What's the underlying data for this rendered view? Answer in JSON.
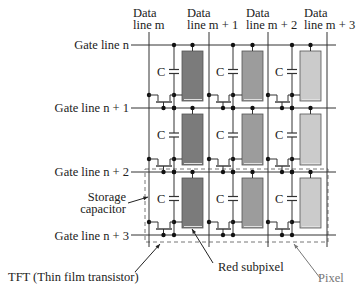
{
  "figure": {
    "type": "TFT active-matrix pixel array diagram",
    "data_lines": [
      {
        "line1": "Data",
        "line2": "line m"
      },
      {
        "line1": "Data",
        "line2": "line m + 1"
      },
      {
        "line1": "Data",
        "line2": "line m + 2"
      },
      {
        "line1": "Data",
        "line2": "line m + 3"
      }
    ],
    "gate_lines": [
      {
        "label": "Gate line n"
      },
      {
        "label": "Gate line n + 1"
      },
      {
        "label": "Gate line n + 2"
      },
      {
        "label": "Gate line n + 3"
      }
    ],
    "capacitor_label": "C",
    "annotations": {
      "storage_capacitor": {
        "line1": "Storage",
        "line2": "capacitor"
      },
      "tft": "TFT (Thin film transistor)",
      "red_subpixel": "Red subpixel",
      "pixel": "Pixel"
    },
    "subpixel_colors": {
      "red": "#7b7b7b",
      "green": "#9c9c9c",
      "blue": "#cbcbcb"
    },
    "rows": 3,
    "columns": 3
  }
}
